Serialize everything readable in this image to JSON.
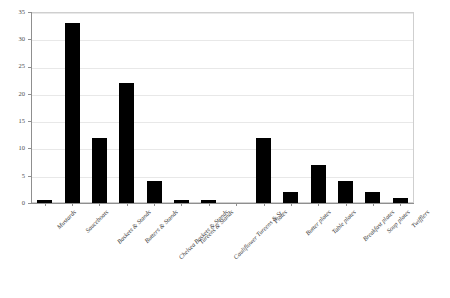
{
  "chart": {
    "title": "",
    "title_note": "cut-off header text at top edge, illegible"
  },
  "chart_data": {
    "type": "bar",
    "title": "",
    "xlabel": "",
    "ylabel": "",
    "ylim": [
      0,
      35
    ],
    "yticks": [
      0,
      5,
      10,
      15,
      20,
      25,
      30,
      35
    ],
    "grid": true,
    "legend": "none",
    "bar_color": "#000000",
    "categories": [
      "Mustards",
      "Sauceboats",
      "Baskets & Stands",
      "Butters & Stands",
      "Chelsea Baskets & Stands",
      "Tureens & Stands",
      "Cauliflower Tureens & St.",
      "",
      "Plates",
      "Butter plates",
      "Table plates",
      "Breakfast plates",
      "Soup plates",
      "Twifflers"
    ],
    "values": [
      0.5,
      33,
      12,
      22,
      4,
      0.5,
      0.5,
      0,
      12,
      2,
      7,
      4,
      2,
      1
    ]
  }
}
